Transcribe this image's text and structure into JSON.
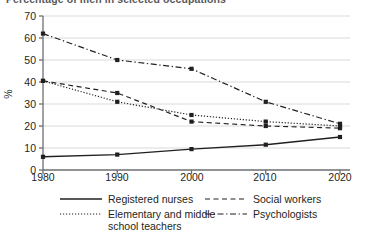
{
  "chart_data": {
    "type": "line",
    "title": "",
    "xlabel": "",
    "ylabel": "%",
    "x": [
      1980,
      1990,
      2000,
      2010,
      2020
    ],
    "categories": [
      "1980",
      "1990",
      "2000",
      "2010",
      "2020"
    ],
    "xlim": [
      1980,
      2020
    ],
    "ylim": [
      0,
      70
    ],
    "yticks": [
      0,
      10,
      20,
      30,
      40,
      50,
      60,
      70
    ],
    "ytick_labels": [
      "0",
      "10",
      "20",
      "30",
      "40",
      "50",
      "60",
      "70"
    ],
    "xtick_labels": [
      "1980",
      "1990",
      "2000",
      "2010",
      "2020"
    ],
    "grid": true,
    "grid_axis": "y",
    "legend_position": "below",
    "markers": true,
    "series": [
      {
        "name": "Registered nurses",
        "style": "solid",
        "values": [
          6,
          7,
          9.5,
          11.5,
          15
        ]
      },
      {
        "name": "Social workers",
        "style": "dashed",
        "values": [
          40.5,
          35,
          22,
          20,
          19
        ]
      },
      {
        "name": "Elementary and middle school teachers",
        "style": "dotted",
        "values": [
          40.5,
          31,
          25,
          22,
          20
        ]
      },
      {
        "name": "Psychologists",
        "style": "dashdot",
        "values": [
          62,
          50,
          46,
          31,
          21
        ]
      }
    ]
  },
  "axis": {
    "y_label": "%",
    "y_ticks": [
      "70",
      "60",
      "50",
      "40",
      "30",
      "20",
      "10",
      "0"
    ],
    "x_ticks": [
      "1980",
      "1990",
      "2000",
      "2010",
      "2020"
    ]
  },
  "legend": {
    "items": [
      {
        "label": "Registered nurses",
        "label2": "",
        "style": "solid"
      },
      {
        "label": "Social workers",
        "label2": "",
        "style": "dashed"
      },
      {
        "label": "Elementary and middle",
        "label2": "school teachers",
        "style": "dotted"
      },
      {
        "label": "Psychologists",
        "label2": "",
        "style": "dashdot"
      }
    ]
  },
  "title": {
    "sliver": "Percentage of men in selected occupations"
  },
  "colors": {
    "line": "#231f20",
    "grid": "#d9d9d9",
    "axis": "#6d6e71",
    "text": "#231f20"
  }
}
